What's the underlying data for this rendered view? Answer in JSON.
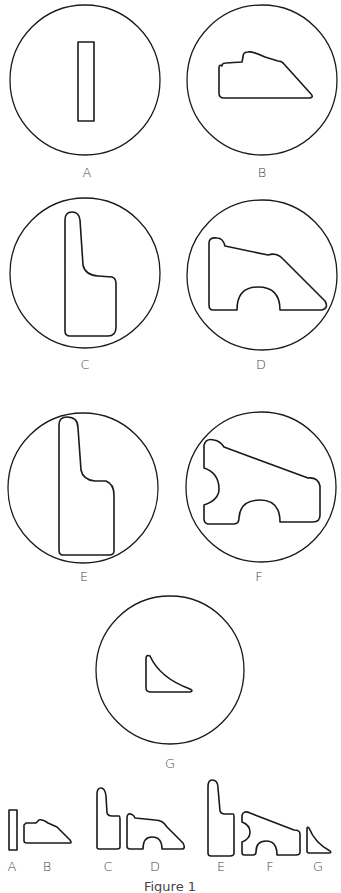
{
  "figure": {
    "caption": "Figure 1",
    "panels": [
      {
        "id": "A",
        "label": "A",
        "shape": "narrow vertical rectangle"
      },
      {
        "id": "B",
        "label": "B",
        "shape": "low profile with sloped right edge and bumps on top"
      },
      {
        "id": "C",
        "label": "C",
        "shape": "tall L-shaped profile with rounded top"
      },
      {
        "id": "D",
        "label": "D",
        "shape": "sloped profile with semicircular notch at bottom"
      },
      {
        "id": "E",
        "label": "E",
        "shape": "taller L-shaped profile with rounded top"
      },
      {
        "id": "F",
        "label": "F",
        "shape": "sloped profile with semicircular notches on left and bottom"
      },
      {
        "id": "G",
        "label": "G",
        "shape": "small curved triangular profile"
      }
    ],
    "summary_labels": [
      "A",
      "B",
      "C",
      "D",
      "E",
      "F",
      "G"
    ]
  },
  "colors": {
    "stroke": "#1a1a1a",
    "label": "#444444",
    "background": "#ffffff"
  }
}
